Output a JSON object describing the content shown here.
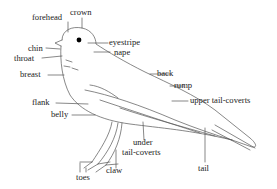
{
  "diagram": {
    "labels": {
      "forehead": "forehead",
      "crown": "crown",
      "eyestripe": "eyestripe",
      "nape": "nape",
      "chin": "chin",
      "throat": "throat",
      "breast": "breast",
      "back": "back",
      "rump": "rump",
      "upper_tail_coverts": "upper tail-coverts",
      "flank": "flank",
      "belly": "belly",
      "under": "under",
      "tail_coverts": "tail-coverts",
      "tail": "tail",
      "claw": "claw",
      "toes": "toes"
    },
    "colors": {
      "ink": "#222222",
      "sketch": "#555555",
      "eye": "#000000"
    }
  }
}
